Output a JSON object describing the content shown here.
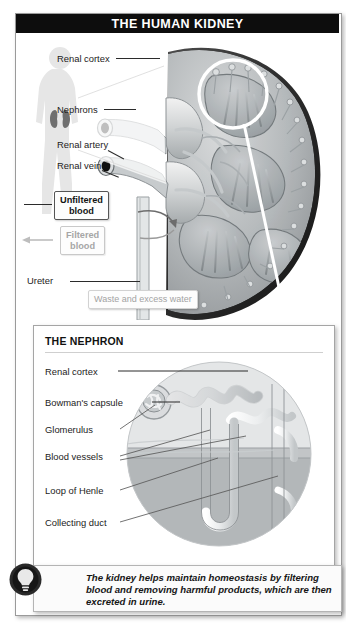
{
  "figure": {
    "title": "THE HUMAN KIDNEY",
    "accent_color": "#0d0d0d",
    "background_color": "#ffffff",
    "artwork_gray": "#8f9396",
    "muted_text_color": "#9d9d9d"
  },
  "kidney_panel": {
    "labels": [
      {
        "id": "renal-cortex",
        "text": "Renal cortex"
      },
      {
        "id": "nephrons",
        "text": "Nephrons"
      },
      {
        "id": "renal-artery",
        "text": "Renal artery"
      },
      {
        "id": "renal-vein",
        "text": "Renal vein"
      },
      {
        "id": "ureter",
        "text": "Ureter"
      }
    ],
    "callouts": [
      {
        "id": "unfiltered-blood",
        "line1": "Unfiltered",
        "line2": "blood",
        "style": "dark"
      },
      {
        "id": "filtered-blood",
        "line1": "Filtered",
        "line2": "blood",
        "style": "soft"
      },
      {
        "id": "waste-water",
        "line1": "Waste and excess water",
        "line2": "",
        "style": "plain"
      }
    ],
    "body_silhouette": {
      "name": "human-body-silhouette",
      "organ_marker": "kidneys"
    },
    "magnifier": {
      "name": "magnifier-circle",
      "description": "white circle highlighting nephron region"
    }
  },
  "nephron_panel": {
    "title": "THE NEPHRON",
    "labels": [
      {
        "id": "renal-cortex",
        "text": "Renal cortex"
      },
      {
        "id": "bowmans-capsule",
        "text": "Bowman's capsule"
      },
      {
        "id": "glomerulus",
        "text": "Glomerulus"
      },
      {
        "id": "blood-vessels",
        "text": "Blood vessels"
      },
      {
        "id": "loop-of-henle",
        "text": "Loop of Henle"
      },
      {
        "id": "collecting-duct",
        "text": "Collecting duct"
      }
    ]
  },
  "caption": {
    "icon": "lightbulb-icon",
    "text": "The kidney helps maintain homeostasis by filtering blood and removing harmful products, which are then excreted in urine."
  }
}
